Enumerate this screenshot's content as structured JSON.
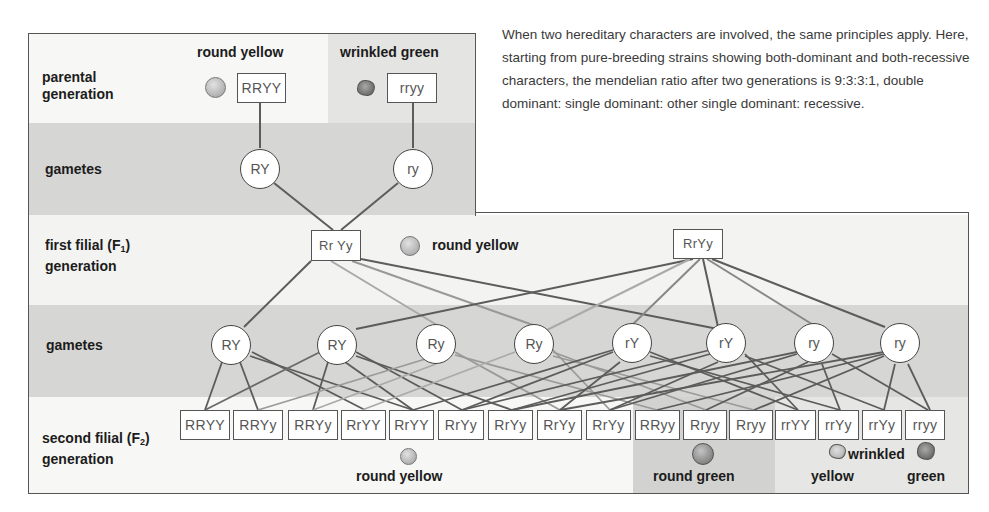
{
  "description": "When two hereditary characters are involved, the same principles apply. Here, starting from pure-breeding strains showing both-dominant and both-recessive characters, the mendelian ratio after two generations is 9:3:3:1, double dominant: single dominant: other single dominant: recessive.",
  "rows": {
    "parental": {
      "line1": "parental",
      "line2": "generation"
    },
    "gametes_top": {
      "label": "gametes"
    },
    "f1": {
      "line1": "first filial (F",
      "sub": "1",
      "line1_end": ")",
      "line2": "generation"
    },
    "gametes_mid": {
      "label": "gametes"
    },
    "f2": {
      "line1": "second filial (F",
      "sub": "2",
      "line1_end": ")",
      "line2": "generation"
    }
  },
  "parental": {
    "left": {
      "trait": "round yellow",
      "genotype": "RRYY",
      "pea": "round-pea-icon"
    },
    "right": {
      "trait": "wrinkled green",
      "genotype": "rryy",
      "pea": "wrinkled-pea-icon"
    }
  },
  "parental_gametes": [
    "RY",
    "ry"
  ],
  "f1": {
    "genotype_left": "Rr Yy",
    "genotype_right": "RrYy",
    "trait": "round yellow"
  },
  "f1_gametes": [
    "RY",
    "RY",
    "Ry",
    "Ry",
    "rY",
    "rY",
    "ry",
    "ry"
  ],
  "f2_genotypes": [
    "RRYY",
    "RRYy",
    "RRYy",
    "RrYY",
    "RrYY",
    "RrYy",
    "RrYy",
    "RrYy",
    "RrYy",
    "RRyy",
    "Rryy",
    "Rryy",
    "rrYY",
    "rrYy",
    "rrYy",
    "rryy"
  ],
  "f2_phenotypes": {
    "round_yellow": "round yellow",
    "round_green": "round green",
    "wrinkled": "wrinkled",
    "wrinkled_yellow": "yellow",
    "wrinkled_green": "green"
  },
  "ratio": "9:3:3:1"
}
